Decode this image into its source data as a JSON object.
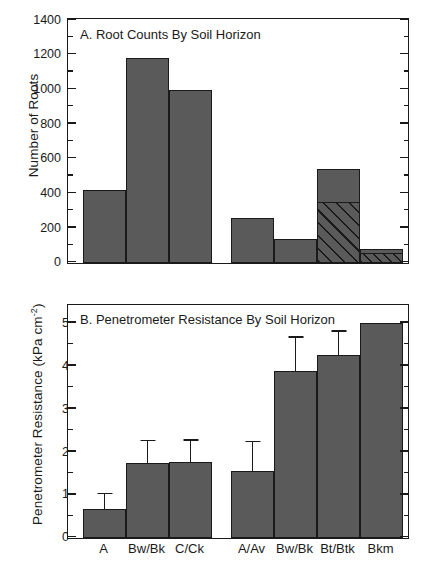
{
  "figure": {
    "background": "#ffffff",
    "bar_fill": "#5a5a5a",
    "line_color": "#1a1a1a"
  },
  "chart_data": [
    {
      "type": "bar",
      "panel": "A",
      "title": "A. Root Counts By Soil Horizon",
      "xlabel": "",
      "ylabel": "Number of Roots",
      "ylim": [
        0,
        1400
      ],
      "yticks": [
        0,
        200,
        400,
        600,
        800,
        1000,
        1200,
        1400
      ],
      "ytick_labels": [
        "0",
        "200",
        "400",
        "600",
        "800",
        "1000",
        "1200",
        "1400"
      ],
      "yminor_step": 100,
      "grid": false,
      "legend": "none",
      "groups": [
        {
          "name": "group-1",
          "categories": [
            "A",
            "Bw/Bk",
            "C/Ck"
          ],
          "values": [
            420,
            1180,
            1000
          ]
        },
        {
          "name": "group-2",
          "categories": [
            "A/Av",
            "Bw/Bk",
            "Bt/Btk",
            "Bkm"
          ],
          "values": [
            258,
            140,
            540,
            80
          ]
        }
      ],
      "segments": [
        {
          "group": "group-2",
          "category": "Bt/Btk",
          "from": 0,
          "to": 348,
          "fill": "diagonal-hatch"
        },
        {
          "group": "group-2",
          "category": "Bkm",
          "from": 0,
          "to": 50,
          "fill": "cross-hatch"
        }
      ]
    },
    {
      "type": "bar",
      "panel": "B",
      "title": "B. Penetrometer Resistance By Soil Horizon",
      "xlabel": "",
      "ylabel": "Penetrometer Resistance (kPa cm",
      "ylabel_sup": "-2",
      "ylabel_tail": ")",
      "ylim": [
        0,
        5.4
      ],
      "yticks": [
        0,
        1,
        2,
        3,
        4,
        5
      ],
      "ytick_labels": [
        "0",
        "1",
        "2",
        "3",
        "4",
        "5"
      ],
      "yminor_step": 0.5,
      "grid": false,
      "legend": "none",
      "groups": [
        {
          "name": "group-1",
          "categories": [
            "A",
            "Bw/Bk",
            "C/Ck"
          ],
          "values": [
            0.67,
            1.75,
            1.78
          ],
          "errors_upper": [
            0.35,
            0.5,
            0.48
          ]
        },
        {
          "name": "group-2",
          "categories": [
            "A/Av",
            "Bw/Bk",
            "Bt/Btk",
            "Bkm"
          ],
          "values": [
            1.56,
            3.9,
            4.27,
            5.01
          ],
          "errors_upper": [
            0.67,
            0.77,
            0.53,
            0
          ]
        }
      ]
    }
  ],
  "xaxis": {
    "labels": [
      "A",
      "Bw/Bk",
      "C/Ck",
      "A/Av",
      "Bw/Bk",
      "Bt/Btk",
      "Bkm"
    ]
  }
}
